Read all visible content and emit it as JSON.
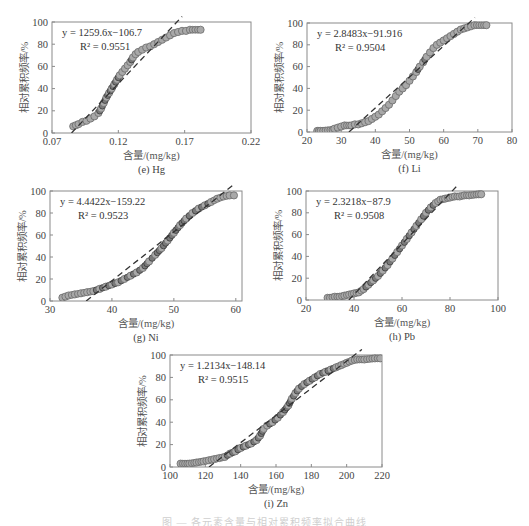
{
  "figure": {
    "caption_partial": "图 — 各元素含量与相对累积频率拟合曲线"
  },
  "chart_data": [
    {
      "id": "e",
      "type": "scatter",
      "panel_label": "(e) Hg",
      "xlabel": "含量/(mg/kg)",
      "ylabel": "相对累积频率/%",
      "xlim": [
        0.07,
        0.22
      ],
      "ylim": [
        0,
        100
      ],
      "xticks": [
        "0.07",
        "0.12",
        "0.17",
        "0.22"
      ],
      "xtick_values": [
        0.07,
        0.12,
        0.17,
        0.22
      ],
      "yticks": [
        "0",
        "20",
        "40",
        "60",
        "80",
        "100"
      ],
      "equation": "y = 1259.6x−106.7",
      "r2": "R² = 0.9551",
      "slope": 1259.6,
      "intercept": -106.7,
      "frame": [
        52,
        22,
        251,
        133
      ],
      "points": [
        [
          0.086,
          6
        ],
        [
          0.088,
          7
        ],
        [
          0.09,
          8
        ],
        [
          0.093,
          10
        ],
        [
          0.096,
          11
        ],
        [
          0.099,
          13
        ],
        [
          0.102,
          15
        ],
        [
          0.105,
          18
        ],
        [
          0.107,
          22
        ],
        [
          0.109,
          27
        ],
        [
          0.111,
          32
        ],
        [
          0.113,
          36
        ],
        [
          0.115,
          40
        ],
        [
          0.117,
          44
        ],
        [
          0.119,
          48
        ],
        [
          0.121,
          52
        ],
        [
          0.123,
          55
        ],
        [
          0.125,
          58
        ],
        [
          0.127,
          61
        ],
        [
          0.129,
          64
        ],
        [
          0.131,
          68
        ],
        [
          0.133,
          71
        ],
        [
          0.135,
          73
        ],
        [
          0.138,
          75
        ],
        [
          0.141,
          77
        ],
        [
          0.144,
          78
        ],
        [
          0.147,
          80
        ],
        [
          0.15,
          82
        ],
        [
          0.153,
          84
        ],
        [
          0.156,
          86
        ],
        [
          0.159,
          88
        ],
        [
          0.162,
          90
        ],
        [
          0.165,
          91
        ],
        [
          0.168,
          92
        ],
        [
          0.171,
          92
        ],
        [
          0.174,
          93
        ],
        [
          0.182,
          93
        ]
      ]
    },
    {
      "id": "f",
      "type": "scatter",
      "panel_label": "(f) Li",
      "xlabel": "含量/(mg/kg)",
      "ylabel": "相对累积频率/%",
      "xlim": [
        20,
        80
      ],
      "ylim": [
        0,
        100
      ],
      "xticks": [
        "20",
        "30",
        "40",
        "50",
        "60",
        "70",
        "80"
      ],
      "xtick_values": [
        20,
        30,
        40,
        50,
        60,
        70,
        80
      ],
      "yticks": [
        "0",
        "20",
        "40",
        "60",
        "80",
        "100"
      ],
      "equation": "y = 2.8483x−91.916",
      "r2": "R² = 0.9504",
      "slope": 2.8483,
      "intercept": -91.916,
      "frame": [
        307,
        23,
        512,
        132
      ],
      "points": [
        [
          23,
          1
        ],
        [
          23.5,
          1
        ],
        [
          24,
          1
        ],
        [
          27.5,
          2
        ],
        [
          28,
          3
        ],
        [
          29,
          4
        ],
        [
          30,
          5
        ],
        [
          31,
          6
        ],
        [
          33,
          6
        ],
        [
          34,
          7
        ],
        [
          35,
          7
        ],
        [
          36,
          8
        ],
        [
          37,
          9
        ],
        [
          38,
          10
        ],
        [
          39,
          12
        ],
        [
          40,
          14
        ],
        [
          41,
          16
        ],
        [
          42,
          19
        ],
        [
          43,
          22
        ],
        [
          44,
          25
        ],
        [
          45,
          29
        ],
        [
          46,
          33
        ],
        [
          47,
          37
        ],
        [
          48,
          40
        ],
        [
          49,
          43
        ],
        [
          50,
          47
        ],
        [
          51,
          51
        ],
        [
          52,
          55
        ],
        [
          53,
          60
        ],
        [
          54,
          64
        ],
        [
          55,
          69
        ],
        [
          56,
          73
        ],
        [
          57,
          77
        ],
        [
          58,
          80
        ],
        [
          59,
          82
        ],
        [
          60,
          84
        ],
        [
          61,
          86
        ],
        [
          62,
          88
        ],
        [
          63,
          90
        ],
        [
          64,
          92
        ],
        [
          65,
          94
        ],
        [
          66,
          95
        ],
        [
          67,
          96
        ],
        [
          68,
          97
        ],
        [
          69,
          98
        ],
        [
          72.5,
          98
        ]
      ]
    },
    {
      "id": "g",
      "type": "scatter",
      "panel_label": "(g) Ni",
      "xlabel": "含量/(mg/kg)",
      "ylabel": "相对累积频率/%",
      "xlim": [
        30,
        61
      ],
      "ylim": [
        0,
        100
      ],
      "xticks": [
        "30",
        "40",
        "50",
        "60"
      ],
      "xtick_values": [
        30,
        40,
        50,
        60
      ],
      "yticks": [
        "0",
        "20",
        "40",
        "60",
        "80",
        "100"
      ],
      "equation": "y = 4.4422x−159.22",
      "r2": "R² = 0.9523",
      "slope": 4.4422,
      "intercept": -159.22,
      "frame": [
        50,
        191,
        242,
        301
      ],
      "points": [
        [
          32,
          3
        ],
        [
          32.5,
          4
        ],
        [
          33,
          5
        ],
        [
          34,
          6
        ],
        [
          35,
          7
        ],
        [
          36,
          8
        ],
        [
          37,
          9
        ],
        [
          38,
          11
        ],
        [
          39,
          13
        ],
        [
          40,
          15
        ],
        [
          41,
          17
        ],
        [
          42,
          20
        ],
        [
          43,
          23
        ],
        [
          44,
          26
        ],
        [
          45,
          30
        ],
        [
          46,
          36
        ],
        [
          47,
          42
        ],
        [
          48,
          48
        ],
        [
          49,
          55
        ],
        [
          50,
          62
        ],
        [
          51,
          69
        ],
        [
          52,
          75
        ],
        [
          53,
          80
        ],
        [
          54,
          84
        ],
        [
          55,
          87
        ],
        [
          56,
          90
        ],
        [
          57,
          93
        ],
        [
          58,
          95
        ],
        [
          59,
          96
        ],
        [
          59.7,
          96
        ]
      ]
    },
    {
      "id": "h",
      "type": "scatter",
      "panel_label": "(h) Pb",
      "xlabel": "含量/(mg/kg)",
      "ylabel": "相对累积频率/%",
      "xlim": [
        20,
        100
      ],
      "ylim": [
        0,
        100
      ],
      "xticks": [
        "20",
        "40",
        "60",
        "80",
        "100"
      ],
      "xtick_values": [
        20,
        40,
        60,
        80,
        100
      ],
      "yticks": [
        "0",
        "20",
        "40",
        "60",
        "80",
        "100"
      ],
      "equation": "y = 2.3218x−87.9",
      "r2": "R² = 0.9508",
      "slope": 2.3218,
      "intercept": -87.9,
      "frame": [
        306,
        191,
        498,
        300
      ],
      "points": [
        [
          29,
          2
        ],
        [
          30,
          2
        ],
        [
          32,
          3
        ],
        [
          34,
          3
        ],
        [
          36,
          4
        ],
        [
          38,
          5
        ],
        [
          40,
          6
        ],
        [
          42,
          7
        ],
        [
          44,
          10
        ],
        [
          46,
          14
        ],
        [
          48,
          18
        ],
        [
          50,
          22
        ],
        [
          52,
          27
        ],
        [
          54,
          32
        ],
        [
          56,
          38
        ],
        [
          58,
          44
        ],
        [
          60,
          50
        ],
        [
          62,
          56
        ],
        [
          64,
          62
        ],
        [
          66,
          68
        ],
        [
          68,
          74
        ],
        [
          70,
          80
        ],
        [
          72,
          85
        ],
        [
          74,
          89
        ],
        [
          76,
          92
        ],
        [
          78,
          93
        ],
        [
          80,
          94
        ],
        [
          82,
          95
        ],
        [
          84,
          95
        ],
        [
          86,
          96
        ],
        [
          88,
          96
        ],
        [
          92,
          97
        ],
        [
          93,
          97
        ]
      ]
    },
    {
      "id": "i",
      "type": "scatter",
      "panel_label": "(i) Zn",
      "xlabel": "含量/(mg/kg)",
      "ylabel": "相对累积频率/%",
      "xlim": [
        100,
        220
      ],
      "ylim": [
        0,
        100
      ],
      "xticks": [
        "100",
        "120",
        "140",
        "160",
        "180",
        "200",
        "220"
      ],
      "xtick_values": [
        100,
        120,
        140,
        160,
        180,
        200,
        220
      ],
      "yticks": [
        "0",
        "20",
        "40",
        "60",
        "80",
        "100"
      ],
      "equation": "y = 1.2134x−148.14",
      "r2": "R² = 0.9515",
      "slope": 1.2134,
      "intercept": -148.14,
      "frame": [
        170,
        355,
        382,
        467
      ],
      "points": [
        [
          106,
          3
        ],
        [
          111,
          3
        ],
        [
          115,
          4
        ],
        [
          119,
          5
        ],
        [
          122,
          6
        ],
        [
          125,
          7
        ],
        [
          128,
          8
        ],
        [
          131,
          9
        ],
        [
          134,
          12
        ],
        [
          137,
          14
        ],
        [
          140,
          17
        ],
        [
          143,
          19
        ],
        [
          146,
          21
        ],
        [
          149,
          24
        ],
        [
          151,
          28
        ],
        [
          153,
          34
        ],
        [
          155,
          37
        ],
        [
          158,
          40
        ],
        [
          161,
          44
        ],
        [
          164,
          49
        ],
        [
          167,
          55
        ],
        [
          169,
          61
        ],
        [
          171,
          66
        ],
        [
          173,
          70
        ],
        [
          176,
          74
        ],
        [
          179,
          77
        ],
        [
          182,
          80
        ],
        [
          185,
          83
        ],
        [
          188,
          85
        ],
        [
          191,
          87
        ],
        [
          194,
          89
        ],
        [
          197,
          91
        ],
        [
          200,
          93
        ],
        [
          203,
          95
        ],
        [
          206,
          96
        ],
        [
          210,
          96
        ],
        [
          216,
          97
        ],
        [
          219,
          97
        ]
      ]
    }
  ]
}
